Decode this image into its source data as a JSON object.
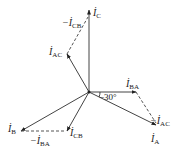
{
  "diagram": {
    "origin": [
      89,
      92
    ],
    "colors": {
      "line": "#444444",
      "dash": "#555555",
      "text": "#1a1a1a",
      "background": "#ffffff"
    },
    "vectors": [
      {
        "id": "I_C",
        "from": [
          89,
          92
        ],
        "to": [
          89,
          10
        ],
        "style": "solid",
        "label": {
          "main": "İ",
          "sub": "C",
          "prefix": "",
          "x": 93,
          "y": 16
        }
      },
      {
        "id": "I_AC",
        "from": [
          89,
          92
        ],
        "to": [
          67,
          54
        ],
        "style": "solid",
        "label": {
          "main": "İ",
          "sub": "AC",
          "prefix": "",
          "x": 49,
          "y": 55
        }
      },
      {
        "id": "I_BA",
        "from": [
          89,
          92
        ],
        "to": [
          136,
          92
        ],
        "style": "solid",
        "label": {
          "main": "İ",
          "sub": "BA",
          "prefix": "",
          "x": 126,
          "y": 87
        }
      },
      {
        "id": "I_A",
        "from": [
          89,
          92
        ],
        "to": [
          156,
          125
        ],
        "style": "solid",
        "label": {
          "main": "İ",
          "sub": "A",
          "prefix": "",
          "x": 151,
          "y": 142
        }
      },
      {
        "id": "I_B",
        "from": [
          89,
          92
        ],
        "to": [
          21,
          131
        ],
        "style": "solid",
        "label": {
          "main": "İ",
          "sub": "B",
          "prefix": "",
          "x": 8,
          "y": 132
        }
      },
      {
        "id": "I_CB",
        "from": [
          89,
          92
        ],
        "to": [
          67,
          131
        ],
        "style": "solid",
        "label": {
          "main": "İ",
          "sub": "CB",
          "prefix": "",
          "x": 70,
          "y": 136
        }
      },
      {
        "id": "neg_I_CB",
        "from": [
          67,
          54
        ],
        "to": [
          88,
          17
        ],
        "style": "dashed",
        "label": {
          "main": "İ",
          "sub": "CB",
          "prefix": "−",
          "x": 62,
          "y": 26
        }
      },
      {
        "id": "neg_I_AC",
        "from": [
          136,
          92
        ],
        "to": [
          156,
          123
        ],
        "style": "dashed",
        "label": {
          "main": "İ",
          "sub": "AC",
          "prefix": "−",
          "x": 150,
          "y": 124
        }
      },
      {
        "id": "neg_I_BA",
        "from": [
          21,
          131
        ],
        "to": [
          66,
          131
        ],
        "style": "dashed",
        "label": {
          "main": "İ",
          "sub": "BA",
          "prefix": "−",
          "x": 30,
          "y": 144
        }
      }
    ],
    "angle": {
      "text": "−30°",
      "x": 99,
      "y": 100,
      "arc": "M 100 92 A 11 11 0 0 1 99 97"
    }
  }
}
